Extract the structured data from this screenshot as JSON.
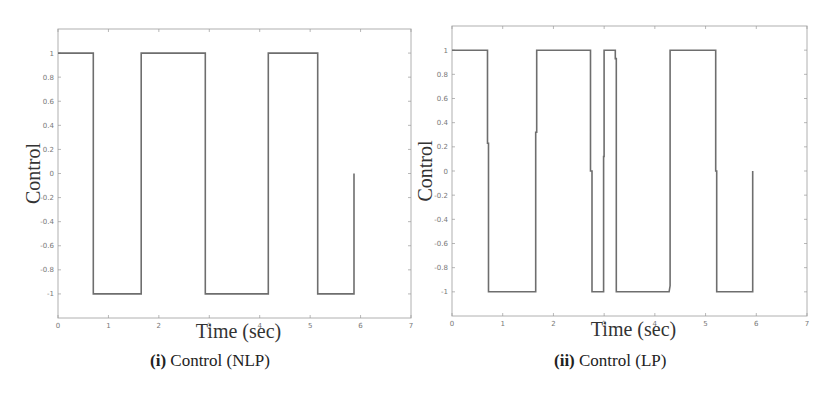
{
  "chart_data": [
    {
      "type": "line",
      "step": true,
      "title": "",
      "caption_prefix": "(i)",
      "caption_text": "Control (NLP)",
      "xlabel": "Time (sec)",
      "ylabel": "Control",
      "xlim": [
        0,
        7
      ],
      "ylim": [
        -1.2,
        1.2
      ],
      "xticks": [
        0,
        1,
        2,
        3,
        4,
        5,
        6,
        7
      ],
      "yticks": [
        1,
        0.8,
        0.6,
        0.4,
        0.2,
        0,
        -0.2,
        -0.4,
        -0.6,
        -0.8,
        -1
      ],
      "ytick_labels": [
        "1",
        "0.8",
        "0.6",
        "0.4",
        "0.2",
        "0",
        "-0.2",
        "-0.4",
        "-0.6",
        "-0.8",
        "-1"
      ],
      "grid": false,
      "line_color": "#6e6e6e",
      "series": [
        {
          "name": "Control (NLP)",
          "x": [
            0,
            0.7,
            0.7,
            1.65,
            1.65,
            2.92,
            2.92,
            4.17,
            4.17,
            5.15,
            5.15,
            5.87,
            5.87
          ],
          "y": [
            1,
            1,
            -1,
            -1,
            1,
            1,
            -1,
            -1,
            1,
            1,
            -1,
            -1,
            0
          ]
        }
      ]
    },
    {
      "type": "line",
      "step": true,
      "title": "",
      "caption_prefix": "(ii)",
      "caption_text": "Control (LP)",
      "xlabel": "Time (sec)",
      "ylabel": "Control",
      "xlim": [
        0,
        7
      ],
      "ylim": [
        -1.2,
        1.2
      ],
      "xticks": [
        0,
        1,
        2,
        3,
        4,
        5,
        6,
        7
      ],
      "yticks": [
        1,
        0.8,
        0.6,
        0.4,
        0.2,
        0,
        -0.2,
        -0.4,
        -0.6,
        -0.8,
        -1
      ],
      "ytick_labels": [
        "1",
        "0.8",
        "0.6",
        "0.4",
        "0.2",
        "0",
        "-0.2",
        "-0.4",
        "-0.6",
        "-0.8",
        "-1"
      ],
      "grid": false,
      "line_color": "#6e6e6e",
      "series": [
        {
          "name": "Control (LP)",
          "x": [
            0,
            0.7,
            0.7,
            0.72,
            0.72,
            1.65,
            1.65,
            1.67,
            1.67,
            2.73,
            2.73,
            2.76,
            2.76,
            2.99,
            2.99,
            3.0,
            3.0,
            3.22,
            3.22,
            3.24,
            3.24,
            4.28,
            4.3,
            4.3,
            5.2,
            5.2,
            5.22,
            5.22,
            5.93,
            5.93
          ],
          "y": [
            1,
            1,
            0.23,
            0.23,
            -1,
            -1,
            0.32,
            0.32,
            1,
            1,
            0,
            0,
            -1,
            -1,
            0.12,
            0.12,
            1,
            1,
            0.93,
            0.93,
            -1,
            -1,
            -0.95,
            1,
            1,
            0,
            0,
            -1,
            -1,
            0
          ]
        }
      ]
    }
  ],
  "figures": [
    {
      "caption_prefix": "(i)",
      "caption_text": "Control (NLP)",
      "xlabel": "Time (sec)",
      "ylabel": "Control"
    },
    {
      "caption_prefix": "(ii)",
      "caption_text": "Control (LP)",
      "xlabel": "Time (sec)",
      "ylabel": "Control"
    }
  ]
}
